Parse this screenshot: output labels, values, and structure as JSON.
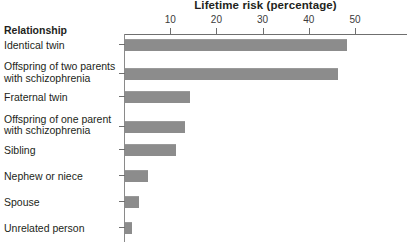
{
  "chart_data": {
    "type": "bar",
    "orientation": "horizontal",
    "title": "Lifetime risk (percentage)",
    "xlabel": "Lifetime risk (percentage)",
    "ylabel": "Relationship",
    "category_header": "Relationship",
    "xlim": [
      0,
      61
    ],
    "xticks": [
      10,
      20,
      30,
      40,
      50
    ],
    "xtick_labels": [
      "10",
      "20",
      "30",
      "40",
      "50"
    ],
    "grid": false,
    "legend": null,
    "bar_color": "#8c8c8c",
    "axis_color": "#6f6f6f",
    "categories": [
      "Identical twin",
      "Offspring of two parents with schizophrenia",
      "Fraternal twin",
      "Offspring of one parent with schizophrenia",
      "Sibling",
      "Nephew or niece",
      "Spouse",
      "Unrelated person"
    ],
    "category_lines": [
      [
        "Identical twin"
      ],
      [
        "Offspring of two parents",
        "with schizophrenia"
      ],
      [
        "Fraternal twin"
      ],
      [
        "Offspring of one parent",
        "with schizophrenia"
      ],
      [
        "Sibling"
      ],
      [
        "Nephew or niece"
      ],
      [
        "Spouse"
      ],
      [
        "Unrelated person"
      ]
    ],
    "values": [
      48,
      46,
      14,
      13,
      11,
      5,
      3,
      1.5
    ]
  }
}
